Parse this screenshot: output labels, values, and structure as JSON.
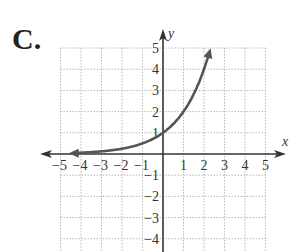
{
  "panel_label": "C.",
  "chart_data": {
    "type": "line",
    "title": "",
    "xlabel": "x",
    "ylabel": "y",
    "xlim": [
      -5,
      5
    ],
    "ylim": [
      -4,
      5
    ],
    "grid": true,
    "x_ticks": [
      "−5",
      "−4",
      "−3",
      "−2",
      "−1",
      "1",
      "2",
      "3",
      "4",
      "5"
    ],
    "y_ticks": [
      "5",
      "4",
      "3",
      "2",
      "1",
      "−1",
      "−2",
      "−3",
      "−4"
    ],
    "series": [
      {
        "name": "y = 2^x",
        "function": "2^x",
        "x": [
          -4.3,
          -4,
          -3,
          -2,
          -1,
          0,
          1,
          2,
          2.32
        ],
        "y": [
          0.05,
          0.06,
          0.13,
          0.25,
          0.5,
          1,
          2,
          4,
          5
        ],
        "arrows": "both",
        "color": "#555555"
      }
    ]
  }
}
